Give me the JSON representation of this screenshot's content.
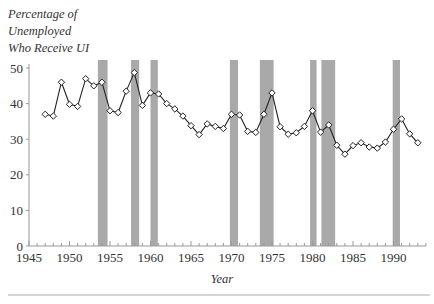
{
  "chart_data": {
    "type": "line",
    "title": "",
    "ylabel_lines": [
      "Percentage of",
      "Unemployed",
      "Who Receive UI"
    ],
    "ylabel": "Percentage of Unemployed Who Receive UI",
    "xlabel": "Year",
    "xlim": [
      1945,
      1994
    ],
    "ylim": [
      0,
      50
    ],
    "x_ticks": [
      1945,
      1950,
      1955,
      1960,
      1965,
      1970,
      1975,
      1980,
      1985,
      1990
    ],
    "y_ticks": [
      0,
      10,
      20,
      30,
      40,
      50
    ],
    "grid": false,
    "legend": null,
    "marker": "diamond-open",
    "series": [
      {
        "name": "Percentage of Unemployed Who Receive UI",
        "x": [
          1947,
          1948,
          1949,
          1950,
          1951,
          1952,
          1953,
          1954,
          1955,
          1956,
          1957,
          1958,
          1959,
          1960,
          1961,
          1962,
          1963,
          1964,
          1965,
          1966,
          1967,
          1968,
          1969,
          1970,
          1971,
          1972,
          1973,
          1974,
          1975,
          1976,
          1977,
          1978,
          1979,
          1980,
          1981,
          1982,
          1983,
          1984,
          1985,
          1986,
          1987,
          1988,
          1989,
          1990,
          1991,
          1992,
          1993
        ],
        "values": [
          37.0,
          36.5,
          46.0,
          39.8,
          39.2,
          47.0,
          45.0,
          46.0,
          38.0,
          37.5,
          43.5,
          48.7,
          39.5,
          43.0,
          42.7,
          40.0,
          38.5,
          36.5,
          33.8,
          31.3,
          34.3,
          33.6,
          33.0,
          37.0,
          36.8,
          32.2,
          31.9,
          37.0,
          43.0,
          33.5,
          31.4,
          31.8,
          33.6,
          38.0,
          32.0,
          34.0,
          28.3,
          25.8,
          28.2,
          29.0,
          27.8,
          27.5,
          29.2,
          32.8,
          35.7,
          31.5,
          29.0
        ]
      }
    ],
    "shaded_periods": [
      {
        "start": 1953.5,
        "end": 1954.7
      },
      {
        "start": 1957.6,
        "end": 1958.6
      },
      {
        "start": 1960.0,
        "end": 1960.9
      },
      {
        "start": 1969.8,
        "end": 1970.8
      },
      {
        "start": 1973.5,
        "end": 1975.2
      },
      {
        "start": 1979.7,
        "end": 1980.5
      },
      {
        "start": 1981.1,
        "end": 1982.8
      },
      {
        "start": 1989.9,
        "end": 1990.8
      }
    ],
    "colors": {
      "line": "#222222",
      "marker_fill": "#ffffff",
      "shade": "#a9a9a9",
      "axis": "#999999",
      "text": "#333333",
      "divider": "#aaaaaa"
    }
  }
}
